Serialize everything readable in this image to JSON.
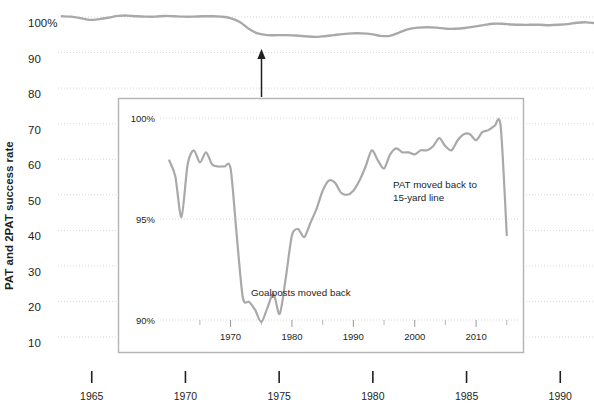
{
  "figure": {
    "background_color": "#ffffff",
    "line_color": "#a9a9a9",
    "grid_color": "#d9d9d9",
    "text_color": "#231f20",
    "inset_border_color": "#b3b3b3",
    "arrow_color": "#231f20"
  },
  "axis": {
    "ylabel": "PAT and 2PAT success rate"
  },
  "chart_data": {
    "type": "line",
    "title": "",
    "xlabel": "",
    "ylabel": "PAT and 2PAT success rate",
    "grid": true,
    "legend": "none",
    "main": {
      "ylim": [
        5,
        102
      ],
      "yticks": [
        100,
        90,
        80,
        70,
        60,
        50,
        40,
        30,
        20,
        10
      ],
      "ytick_labels": [
        "100%",
        "90",
        "80",
        "70",
        "60",
        "50",
        "40",
        "30",
        "20",
        "10"
      ],
      "xlim": [
        1963.2,
        1991.8
      ],
      "xticks": [
        1965,
        1970,
        1975,
        1980,
        1985,
        1990
      ],
      "xtick_labels": [
        "1965",
        "1970",
        "1975",
        "1980",
        "1985",
        "1990"
      ],
      "series": [
        {
          "name": "PAT and 2PAT success rate",
          "x": [
            1963.4,
            1963.9,
            1964.4,
            1964.9,
            1965.4,
            1965.9,
            1966.4,
            1966.9,
            1967.4,
            1967.9,
            1968.4,
            1968.9,
            1969.4,
            1969.9,
            1970.4,
            1970.9,
            1971.4,
            1971.9,
            1972.4,
            1972.9,
            1973.4,
            1973.9,
            1974.4,
            1974.9,
            1975.4,
            1975.9,
            1976.4,
            1976.9,
            1977.4,
            1977.9,
            1978.4,
            1978.9,
            1979.4,
            1979.9,
            1980.4,
            1980.9,
            1981.4,
            1981.9,
            1982.4,
            1982.9,
            1983.4,
            1983.9,
            1984.4,
            1984.9,
            1985.4,
            1985.9,
            1986.4,
            1986.9,
            1987.4,
            1987.9,
            1988.4,
            1988.9,
            1989.4,
            1989.9,
            1990.4,
            1990.9,
            1991.4,
            1991.8
          ],
          "y": [
            100.2,
            100.1,
            99.7,
            99.2,
            99.4,
            99.8,
            100.3,
            100.4,
            100.2,
            100.1,
            100.1,
            100.3,
            100.2,
            100.1,
            100.1,
            100.2,
            100.2,
            100.1,
            99.7,
            98.6,
            96.6,
            95.3,
            94.9,
            94.9,
            94.9,
            94.8,
            94.6,
            94.4,
            94.6,
            94.9,
            95.2,
            95.4,
            95.4,
            95.2,
            94.7,
            94.7,
            95.6,
            96.6,
            97.0,
            97.1,
            97.0,
            96.7,
            96.7,
            96.9,
            97.3,
            97.7,
            98.1,
            98.1,
            97.9,
            97.8,
            97.8,
            97.8,
            97.7,
            97.8,
            98.0,
            98.4,
            98.5,
            98.3
          ]
        }
      ]
    },
    "inset": {
      "ylim": [
        89.3,
        100.9
      ],
      "yticks": [
        100,
        95,
        90
      ],
      "ytick_labels": [
        "100%",
        "95%",
        "90%"
      ],
      "xlim": [
        1958.5,
        2016.5
      ],
      "xticks": [
        1970,
        1980,
        1990,
        2000,
        2010
      ],
      "xtick_labels": [
        "1970",
        "1980",
        "1990",
        "2000",
        "2010"
      ],
      "minor_xticks": [
        1965,
        1975,
        1985,
        1995,
        2005,
        2015
      ],
      "series": [
        {
          "name": "PAT and 2PAT success rate",
          "x": [
            1960,
            1961,
            1962,
            1963,
            1964,
            1965,
            1966,
            1967,
            1968,
            1969,
            1970,
            1971,
            1972,
            1973,
            1974,
            1975,
            1976,
            1977,
            1978,
            1979,
            1980,
            1981,
            1982,
            1983,
            1984,
            1985,
            1986,
            1987,
            1988,
            1989,
            1990,
            1991,
            1992,
            1993,
            1994,
            1995,
            1996,
            1997,
            1998,
            1999,
            2000,
            2001,
            2002,
            2003,
            2004,
            2005,
            2006,
            2007,
            2008,
            2009,
            2010,
            2011,
            2012,
            2013,
            2014,
            2015
          ],
          "y": [
            97.9,
            97.1,
            95.1,
            97.7,
            98.4,
            97.8,
            98.3,
            97.7,
            97.6,
            97.6,
            97.5,
            94.2,
            91.1,
            90.9,
            90.5,
            89.9,
            90.6,
            91.3,
            90.3,
            92.1,
            94.2,
            94.5,
            94.1,
            94.8,
            95.5,
            96.4,
            96.9,
            96.8,
            96.3,
            96.2,
            96.4,
            96.9,
            97.6,
            98.4,
            97.9,
            97.5,
            98.2,
            98.5,
            98.3,
            98.3,
            98.2,
            98.4,
            98.4,
            98.6,
            99.0,
            98.6,
            98.4,
            98.9,
            99.2,
            99.2,
            98.9,
            99.3,
            99.4,
            99.6,
            99.6,
            94.2
          ]
        }
      ],
      "annotations": [
        {
          "text_line1": "Goalposts moved back",
          "text_line2": ""
        },
        {
          "text_line1": "PAT moved back to",
          "text_line2": "15-yard line"
        }
      ]
    }
  },
  "annotations": {
    "goalposts": "Goalposts moved back",
    "pat_line1": "PAT moved back to",
    "pat_line2": "15-yard line"
  }
}
